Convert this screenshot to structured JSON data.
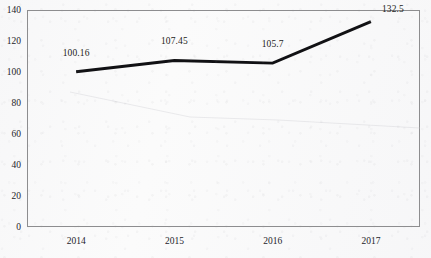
{
  "chart_data": {
    "type": "line",
    "title": "",
    "subtitle": "",
    "xlabel": "",
    "ylabel": "",
    "categories": [
      "2014",
      "2015",
      "2016",
      "2017"
    ],
    "series": [
      {
        "name": "",
        "values": [
          100.16,
          107.45,
          105.7,
          132.5
        ],
        "labels": [
          "100.16",
          "107.45",
          "105.7",
          "132.5"
        ],
        "color": "#111114",
        "line_width": 2.9,
        "markers": false
      }
    ],
    "ylim": [
      0,
      140
    ],
    "yticks": [
      0,
      20,
      40,
      60,
      80,
      100,
      120,
      140
    ],
    "ytick_labels": [
      "0",
      "20",
      "40",
      "60",
      "80",
      "100",
      "120",
      "140"
    ],
    "xtick_labels": [
      "2014",
      "2015",
      "2016",
      "2017"
    ],
    "grid": false,
    "legend": false,
    "legend_position": "none",
    "data_labels": true,
    "frame": "full-box",
    "background_color": "#fbfbfb",
    "axis_color": "#8d8d8f",
    "text_color": "#24242a"
  },
  "accessibility": {
    "chart_region_name": "line-chart",
    "plot_area_name": "plot-area"
  }
}
